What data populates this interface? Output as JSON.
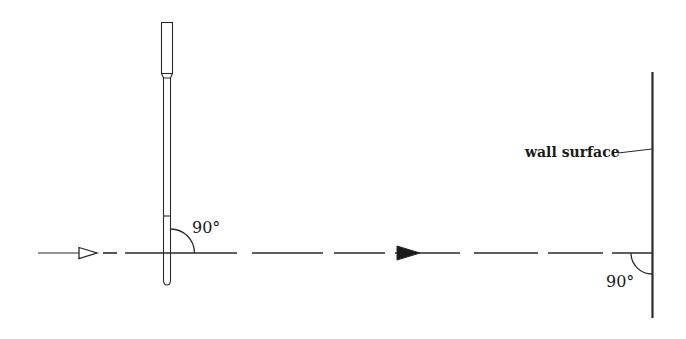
{
  "diagram": {
    "type": "optics-alignment-schematic",
    "labels": {
      "rod_angle": "90°",
      "wall_angle": "90°",
      "wall": "wall surface"
    },
    "elements": {
      "rod": "vertical rod / staff with cap at top and crosshair mark",
      "beam": "dashed horizontal line of sight with open arrowhead (source) and filled arrowhead (direction)",
      "wall": "vertical wall surface at right"
    },
    "colors": {
      "stroke": "#2a2a2a",
      "background": "#ffffff"
    }
  }
}
